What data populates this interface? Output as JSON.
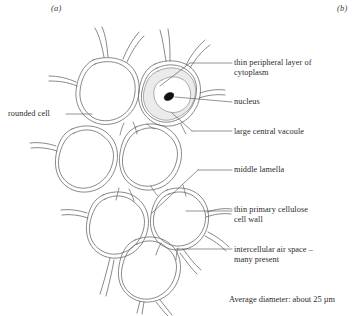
{
  "figure": {
    "panel_tags": [
      {
        "name": "panel-a",
        "text": "(a)"
      },
      {
        "name": "panel-b",
        "text": "(b)"
      }
    ],
    "caption": "Average diameter: about 25 µm"
  },
  "labels": {
    "rounded_cell": "rounded cell",
    "cytoplasm": "thin peripheral layer of\ncytoplasm",
    "nucleus": "nucleus",
    "vacuole": "large central vacoule",
    "middle_lamella": "middle lamella",
    "cell_wall": "thin primary cellulose\ncell wall",
    "air_space": "intercellular air space –\nmany present"
  },
  "colors": {
    "ink": "#2c2c2c",
    "line": "#6b6b6b",
    "cytoplasm_fill": "#ebebeb",
    "nucleus_fill": "#111111",
    "background": "#ffffff"
  }
}
